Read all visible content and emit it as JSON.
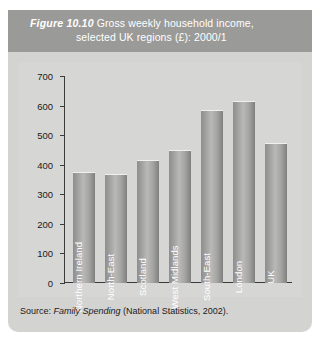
{
  "figure": {
    "number": "Figure 10.10",
    "title_line1": "Gross weekly household income,",
    "title_line2": "selected UK regions (£): 2000/1",
    "source_prefix": "Source:",
    "source_italic": "Family Spending",
    "source_suffix": "(National Statistics, 2002)."
  },
  "colors": {
    "panel_background": "#d3d3d1",
    "title_band": "#9a9a98",
    "plot_background": "#d6d6d4",
    "bar_light": "#b9b9b7",
    "bar_dark": "#7e7e7c",
    "axis": "#3a3a3a",
    "title_text": "#ffffff",
    "bar_label_text": "#ffffff"
  },
  "chart_data": {
    "type": "bar",
    "title": "Gross weekly household income, selected UK regions (£): 2000/1",
    "xlabel": "",
    "ylabel": "",
    "categories": [
      "Northern Ireland",
      "North-East",
      "Scotland",
      "West Midlands",
      "South-East",
      "London",
      "UK"
    ],
    "values": [
      375,
      370,
      415,
      450,
      585,
      615,
      475
    ],
    "ylim": [
      0,
      700
    ],
    "yticks": [
      0,
      100,
      200,
      300,
      400,
      500,
      600,
      700
    ],
    "ytick_labels": [
      "0",
      "100",
      "200",
      "300",
      "400",
      "500",
      "600",
      "700"
    ],
    "grid": false,
    "legend": "none",
    "units": "£ per week"
  }
}
